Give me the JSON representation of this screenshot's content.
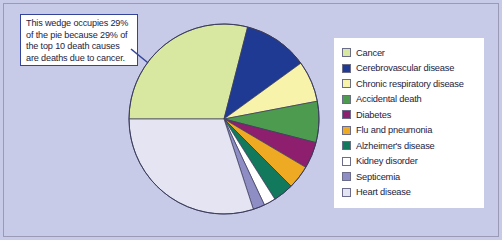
{
  "figure": {
    "background_color": "#c8cbe8",
    "frame_border_color": "#9a9ab4"
  },
  "annotation": {
    "text": "This wedge occupies 29%\nof the pie because 29% of\nthe top 10 death causes\nare deaths due to cancer.",
    "border_color": "#33449a",
    "background_color": "#ffffff",
    "arrow_color": "#33449a",
    "points_to": "Cancer"
  },
  "legend": {
    "background_color": "#ffffff",
    "items": [
      {
        "label": "Cancer",
        "color": "#d9e8a0"
      },
      {
        "label": "Cerebrovascular disease",
        "color": "#1f3a93"
      },
      {
        "label": "Chronic respiratory disease",
        "color": "#f7f3ab"
      },
      {
        "label": "Accidental death",
        "color": "#4d9b4f"
      },
      {
        "label": "Diabetes",
        "color": "#8e1f6e"
      },
      {
        "label": "Flu and pneumonia",
        "color": "#eeaa22"
      },
      {
        "label": "Alzheimer's disease",
        "color": "#12795c"
      },
      {
        "label": "Kidney disorder",
        "color": "#ffffff"
      },
      {
        "label": "Septicemia",
        "color": "#8e8ec4"
      },
      {
        "label": "Heart disease",
        "color": "#e4e4f2"
      }
    ]
  },
  "chart_data": {
    "type": "pie",
    "title": "",
    "start_angle_deg": 180,
    "direction": "clockwise",
    "outline_color": "#3b3b5c",
    "center": {
      "x": 98,
      "y": 97
    },
    "radius": 95,
    "labels": [
      "Cancer",
      "Cerebrovascular disease",
      "Chronic respiratory disease",
      "Accidental death",
      "Diabetes",
      "Flu and pneumonia",
      "Alzheimer's disease",
      "Kidney disorder",
      "Septicemia",
      "Heart disease"
    ],
    "values": [
      29,
      11,
      7,
      7,
      4.5,
      4,
      3.5,
      2,
      2,
      30
    ],
    "colors": [
      "#d9e8a0",
      "#1f3a93",
      "#f7f3ab",
      "#4d9b4f",
      "#8e1f6e",
      "#eeaa22",
      "#12795c",
      "#ffffff",
      "#8e8ec4",
      "#e4e4f2"
    ],
    "annotations": [
      {
        "target": "Cancer",
        "value_percent": 29,
        "text": "This wedge occupies 29% of the pie because 29% of the top 10 death causes are deaths due to cancer."
      }
    ],
    "legend_position": "right",
    "grid": false
  }
}
